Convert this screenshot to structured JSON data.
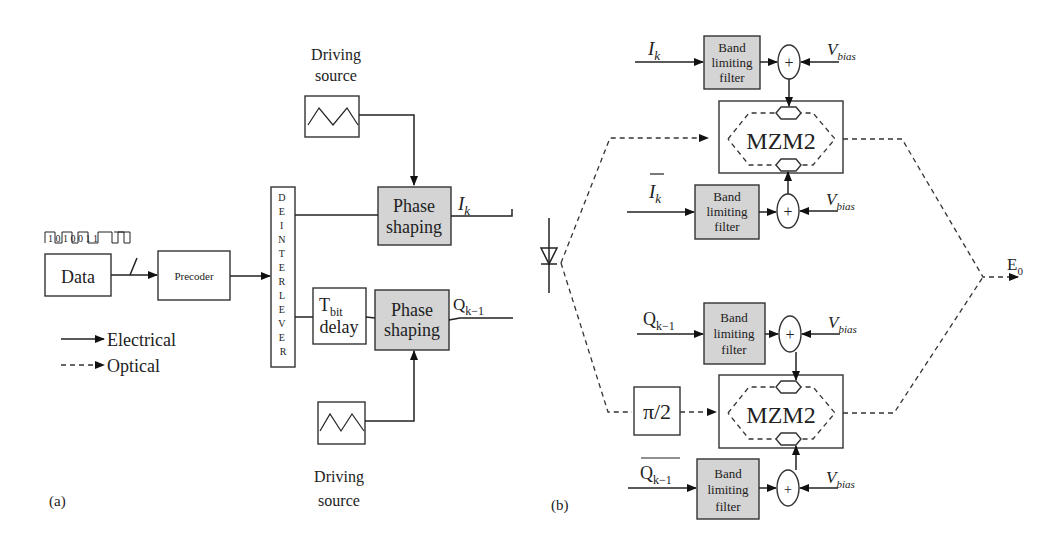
{
  "panel_a": {
    "label": "(a)",
    "bit_pattern": "1 0 1 0 0 1 1",
    "data_label": "Data",
    "precoder_label": "Precoder",
    "deinterleaver_letters": [
      "D",
      "E",
      "I",
      "N",
      "T",
      "E",
      "R",
      "L",
      "E",
      "V",
      "E",
      "R"
    ],
    "driving_source_top": {
      "line1": "Driving",
      "line2": "source"
    },
    "driving_source_bottom": {
      "line1": "Driving",
      "line2": "source"
    },
    "phase_shaping_top": {
      "line1": "Phase",
      "line2": "shaping"
    },
    "phase_shaping_bottom": {
      "line1": "Phase",
      "line2": "shaping"
    },
    "delay": {
      "main": "T",
      "sub": "bit",
      "line2": "delay"
    },
    "output_top": {
      "main": "I",
      "sub": "k"
    },
    "output_bottom": {
      "main": "Q",
      "sub": "k−1"
    },
    "legend": {
      "electrical": "Electrical",
      "optical": "Optical"
    }
  },
  "panel_b": {
    "label": "(b)",
    "filter": {
      "line1": "Band",
      "line2": "limiting",
      "line3": "filter"
    },
    "vbias": {
      "main": "V",
      "sub": "bias"
    },
    "mzm_label": "MZM2",
    "phase_shift": "π/2",
    "inputs": [
      {
        "main": "I",
        "sub": "k",
        "bar": false
      },
      {
        "main": "I",
        "sub": "k",
        "bar": true
      },
      {
        "main": "Q",
        "sub": "k−1",
        "bar": false
      },
      {
        "main": "Q",
        "sub": "k−1",
        "bar": true
      }
    ],
    "output": {
      "main": "E",
      "sub": "0"
    },
    "adder_symbol": "+"
  }
}
